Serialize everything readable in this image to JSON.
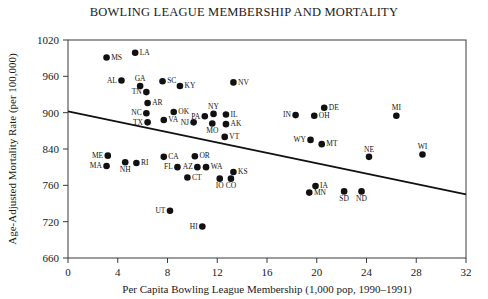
{
  "chart_data": {
    "type": "scatter",
    "title": "BOWLING LEAGUE MEMBERSHIP AND MORTALITY",
    "xlabel": "Per Capita Bowling League Membership (1,000 pop, 1990–1991)",
    "ylabel": "Age-Adjusted Mortality Rate (per 100,000)",
    "xlim": [
      0,
      32
    ],
    "ylim": [
      660,
      1020
    ],
    "xticks": [
      0,
      4,
      8,
      12,
      16,
      20,
      24,
      28,
      32
    ],
    "xtick_labels": [
      "0",
      "4",
      "8",
      "12",
      "16",
      "20",
      "24",
      "28",
      "32"
    ],
    "yticks": [
      660,
      720,
      780,
      840,
      900,
      960,
      1020
    ],
    "ytick_labels": [
      "660",
      "720",
      "760",
      "840",
      "900",
      "960",
      "1020"
    ],
    "grid": false,
    "legend": false,
    "points": [
      {
        "label": "MS",
        "x": 3.1,
        "y": 991,
        "lp": "right"
      },
      {
        "label": "LA",
        "x": 5.4,
        "y": 999,
        "lp": "right"
      },
      {
        "label": "AL",
        "x": 4.3,
        "y": 953,
        "lp": "left"
      },
      {
        "label": "GA",
        "x": 5.8,
        "y": 944,
        "lp": "above"
      },
      {
        "label": "SC",
        "x": 7.6,
        "y": 952,
        "lp": "right"
      },
      {
        "label": "KY",
        "x": 9.0,
        "y": 944,
        "lp": "right"
      },
      {
        "label": "TN",
        "x": 6.3,
        "y": 934,
        "lp": "left"
      },
      {
        "label": "AR",
        "x": 6.4,
        "y": 916,
        "lp": "right"
      },
      {
        "label": "NC",
        "x": 6.3,
        "y": 899,
        "lp": "left"
      },
      {
        "label": "OK",
        "x": 8.5,
        "y": 901,
        "lp": "right"
      },
      {
        "label": "TX",
        "x": 6.4,
        "y": 884,
        "lp": "left"
      },
      {
        "label": "VA",
        "x": 7.7,
        "y": 888,
        "lp": "right"
      },
      {
        "label": "NV",
        "x": 13.3,
        "y": 950,
        "lp": "right"
      },
      {
        "label": "PA",
        "x": 11.0,
        "y": 894,
        "lp": "left"
      },
      {
        "label": "NY",
        "x": 11.7,
        "y": 898,
        "lp": "above"
      },
      {
        "label": "IL",
        "x": 12.7,
        "y": 897,
        "lp": "right"
      },
      {
        "label": "NJ",
        "x": 10.1,
        "y": 884,
        "lp": "left"
      },
      {
        "label": "MO",
        "x": 11.6,
        "y": 882,
        "lp": "below"
      },
      {
        "label": "AK",
        "x": 12.7,
        "y": 881,
        "lp": "right"
      },
      {
        "label": "DE",
        "x": 20.6,
        "y": 908,
        "lp": "right"
      },
      {
        "label": "IN",
        "x": 18.3,
        "y": 896,
        "lp": "left"
      },
      {
        "label": "OH",
        "x": 19.8,
        "y": 895,
        "lp": "right"
      },
      {
        "label": "MI",
        "x": 26.4,
        "y": 895,
        "lp": "above"
      },
      {
        "label": "VT",
        "x": 12.6,
        "y": 860,
        "lp": "right"
      },
      {
        "label": "WY",
        "x": 19.5,
        "y": 855,
        "lp": "left"
      },
      {
        "label": "MT",
        "x": 20.4,
        "y": 848,
        "lp": "right"
      },
      {
        "label": "NE",
        "x": 24.2,
        "y": 827,
        "lp": "above"
      },
      {
        "label": "WI",
        "x": 28.5,
        "y": 831,
        "lp": "above"
      },
      {
        "label": "ME",
        "x": 3.2,
        "y": 829,
        "lp": "left"
      },
      {
        "label": "MA",
        "x": 3.1,
        "y": 812,
        "lp": "left"
      },
      {
        "label": "NH",
        "x": 4.6,
        "y": 818,
        "lp": "below"
      },
      {
        "label": "RI",
        "x": 5.5,
        "y": 817,
        "lp": "right"
      },
      {
        "label": "CA",
        "x": 7.7,
        "y": 827,
        "lp": "right"
      },
      {
        "label": "OR",
        "x": 10.2,
        "y": 828,
        "lp": "right"
      },
      {
        "label": "FL",
        "x": 8.8,
        "y": 810,
        "lp": "left"
      },
      {
        "label": "AZ",
        "x": 10.4,
        "y": 810,
        "lp": "left"
      },
      {
        "label": "WA",
        "x": 11.1,
        "y": 810,
        "lp": "right"
      },
      {
        "label": "CT",
        "x": 9.6,
        "y": 793,
        "lp": "right"
      },
      {
        "label": "IO",
        "x": 12.2,
        "y": 791,
        "lp": "below"
      },
      {
        "label": "CO",
        "x": 13.1,
        "y": 791,
        "lp": "below"
      },
      {
        "label": "KS",
        "x": 13.3,
        "y": 802,
        "lp": "right"
      },
      {
        "label": "UT",
        "x": 8.2,
        "y": 738,
        "lp": "left"
      },
      {
        "label": "HI",
        "x": 10.8,
        "y": 712,
        "lp": "left"
      },
      {
        "label": "IA",
        "x": 19.9,
        "y": 779,
        "lp": "right"
      },
      {
        "label": "MN",
        "x": 19.4,
        "y": 768,
        "lp": "right"
      },
      {
        "label": "SD",
        "x": 22.2,
        "y": 770,
        "lp": "below"
      },
      {
        "label": "ND",
        "x": 23.6,
        "y": 770,
        "lp": "below"
      }
    ],
    "trend_line": {
      "x_start": 0,
      "y_start": 902,
      "x_end": 32,
      "y_end": 765
    }
  }
}
